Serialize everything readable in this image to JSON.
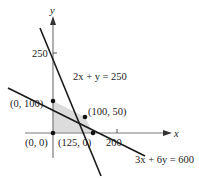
{
  "figure": {
    "axes": {
      "x_label": "x",
      "y_label": "y",
      "y_tick_label": "250",
      "x_tick_label": "200"
    },
    "lines": [
      {
        "equation": "2x + y = 250"
      },
      {
        "equation": "3x + 6y = 600"
      }
    ],
    "vertices": [
      {
        "label": "(0, 0)"
      },
      {
        "label": "(0, 100)"
      },
      {
        "label": "(100, 50)"
      },
      {
        "label": "(125, 0)"
      }
    ],
    "colors": {
      "feasible_region": "#dcdcdc",
      "lines": "#1a1a1a",
      "axes": "#7a7a7a"
    }
  }
}
